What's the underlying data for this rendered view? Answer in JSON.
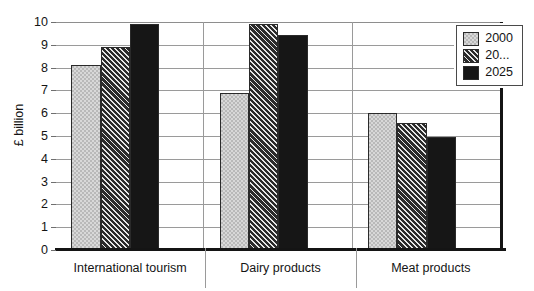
{
  "chart_data": {
    "type": "bar",
    "title": "",
    "xlabel": "",
    "ylabel": "£ billion",
    "ylim": [
      0,
      10
    ],
    "yticks": [
      "0",
      "1",
      "2",
      "3",
      "4",
      "5",
      "6",
      "7",
      "8",
      "9",
      "10"
    ],
    "grid": true,
    "legend_position": "top-right",
    "categories": [
      "International tourism",
      "Dairy products",
      "Meat products"
    ],
    "series": [
      {
        "name": "2000",
        "values": [
          8.1,
          6.9,
          6.0
        ]
      },
      {
        "name": "20...",
        "values": [
          8.9,
          9.9,
          5.55
        ]
      },
      {
        "name": "2025",
        "values": [
          9.9,
          9.45,
          4.95
        ]
      }
    ]
  },
  "legend": {
    "entries": [
      {
        "label": "2000",
        "swatch": "checker-swatch"
      },
      {
        "label": "20...",
        "swatch": "hatch-swatch"
      },
      {
        "label": "2025",
        "swatch": "solid-swatch"
      }
    ]
  },
  "axis": {
    "y_title": "£ billion"
  },
  "colors": {
    "series1_fill": "#b9b9b9",
    "series2_fill": "#3b3b3b",
    "series3_fill": "#161616",
    "grid": "#9a9a9a",
    "axis": "#141414",
    "text": "#141414",
    "background": "#ffffff"
  }
}
